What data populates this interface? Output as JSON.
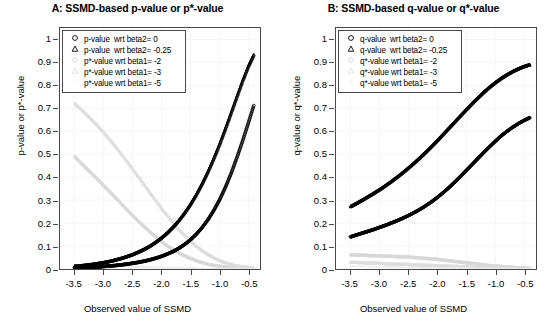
{
  "figure": {
    "width": 551,
    "height": 333,
    "background": "#ffffff"
  },
  "chart_data": [
    {
      "id": "panel-A",
      "type": "scatter",
      "title": "A: SSMD-based p-value or p*-value",
      "xlabel": "Observed value of SSMD",
      "ylabel": "p-value or p*-value",
      "xlim": [
        -3.75,
        -0.3
      ],
      "ylim": [
        0,
        1.05
      ],
      "xticks": [
        -3.5,
        -3.0,
        -2.5,
        -2.0,
        -1.5,
        -1.0,
        -0.5
      ],
      "xticklabels": [
        "-3.5",
        "-3.0",
        "-2.5",
        "-2.0",
        "-1.5",
        "-1.0",
        "-0.5"
      ],
      "yticks": [
        0,
        0.1,
        0.2,
        0.3,
        0.4,
        0.5,
        0.6,
        0.7,
        0.8,
        0.9,
        1
      ],
      "yticklabels": [
        "0",
        "0.1",
        "0.2",
        "0.3",
        "0.4",
        "0.5",
        "0.6",
        "0.7",
        "0.8",
        "0.9",
        "1"
      ],
      "grid": true,
      "legend_position": "top-left",
      "series": [
        {
          "name": "p-value  wrt beta2= 0",
          "symbol": "circle",
          "color": "#000000",
          "x": [
            -3.5,
            -3.4,
            -3.3,
            -3.2,
            -3.1,
            -3.0,
            -2.9,
            -2.8,
            -2.7,
            -2.6,
            -2.5,
            -2.4,
            -2.3,
            -2.2,
            -2.1,
            -2.0,
            -1.9,
            -1.8,
            -1.7,
            -1.6,
            -1.5,
            -1.4,
            -1.3,
            -1.2,
            -1.1,
            -1.0,
            -0.9,
            -0.8,
            -0.7,
            -0.6,
            -0.5,
            -0.4
          ],
          "y": [
            0.005,
            0.006,
            0.007,
            0.008,
            0.009,
            0.011,
            0.013,
            0.015,
            0.018,
            0.021,
            0.025,
            0.029,
            0.034,
            0.04,
            0.047,
            0.055,
            0.065,
            0.076,
            0.09,
            0.107,
            0.127,
            0.151,
            0.18,
            0.214,
            0.254,
            0.3,
            0.354,
            0.415,
            0.484,
            0.558,
            0.637,
            0.718
          ]
        },
        {
          "name": "p-value  wrt beta2= -0.25",
          "symbol": "triangle",
          "color": "#000000",
          "x": [
            -3.5,
            -3.4,
            -3.3,
            -3.2,
            -3.1,
            -3.0,
            -2.9,
            -2.8,
            -2.7,
            -2.6,
            -2.5,
            -2.4,
            -2.3,
            -2.2,
            -2.1,
            -2.0,
            -1.9,
            -1.8,
            -1.7,
            -1.6,
            -1.5,
            -1.4,
            -1.3,
            -1.2,
            -1.1,
            -1.0,
            -0.9,
            -0.8,
            -0.7,
            -0.6,
            -0.5,
            -0.4
          ],
          "y": [
            0.012,
            0.014,
            0.017,
            0.02,
            0.024,
            0.028,
            0.033,
            0.039,
            0.046,
            0.054,
            0.063,
            0.074,
            0.086,
            0.1,
            0.117,
            0.136,
            0.158,
            0.183,
            0.212,
            0.245,
            0.282,
            0.324,
            0.371,
            0.423,
            0.48,
            0.542,
            0.609,
            0.679,
            0.75,
            0.82,
            0.884,
            0.938
          ]
        },
        {
          "name": "p*-value wrt beta1= -2",
          "symbol": "circle",
          "color": "#d6d6d6",
          "x": [
            -3.5,
            -3.4,
            -3.3,
            -3.2,
            -3.1,
            -3.0,
            -2.9,
            -2.8,
            -2.7,
            -2.6,
            -2.5,
            -2.4,
            -2.3,
            -2.2,
            -2.1,
            -2.0,
            -1.9,
            -1.8,
            -1.7,
            -1.6,
            -1.5,
            -1.4,
            -1.3,
            -1.2,
            -1.1,
            -1.0,
            -0.9,
            -0.8,
            -0.7,
            -0.6,
            -0.5,
            -0.4
          ],
          "y": [
            0.49,
            0.465,
            0.44,
            0.415,
            0.39,
            0.364,
            0.338,
            0.312,
            0.286,
            0.26,
            0.234,
            0.209,
            0.185,
            0.162,
            0.14,
            0.12,
            0.101,
            0.085,
            0.07,
            0.057,
            0.046,
            0.036,
            0.028,
            0.021,
            0.016,
            0.012,
            0.009,
            0.006,
            0.004,
            0.003,
            0.002,
            0.001
          ]
        },
        {
          "name": "p*-value wrt beta1= -3",
          "symbol": "triangle",
          "color": "#dedede",
          "x": [
            -3.5,
            -3.4,
            -3.3,
            -3.2,
            -3.1,
            -3.0,
            -2.9,
            -2.8,
            -2.7,
            -2.6,
            -2.5,
            -2.4,
            -2.3,
            -2.2,
            -2.1,
            -2.0,
            -1.9,
            -1.8,
            -1.7,
            -1.6,
            -1.5,
            -1.4,
            -1.3,
            -1.2,
            -1.1,
            -1.0,
            -0.9,
            -0.8,
            -0.7,
            -0.6,
            -0.5,
            -0.4
          ],
          "y": [
            0.722,
            0.7,
            0.676,
            0.651,
            0.625,
            0.597,
            0.568,
            0.537,
            0.505,
            0.472,
            0.438,
            0.404,
            0.369,
            0.334,
            0.3,
            0.266,
            0.234,
            0.203,
            0.174,
            0.147,
            0.123,
            0.101,
            0.081,
            0.064,
            0.05,
            0.038,
            0.028,
            0.02,
            0.014,
            0.01,
            0.007,
            0.004
          ]
        },
        {
          "name": "p*-value wrt beta1= -5",
          "symbol": "dot",
          "color": "#ebebeb",
          "x": [
            -3.5,
            -3.4,
            -3.3,
            -3.2,
            -3.1,
            -3.0,
            -2.9,
            -2.8,
            -2.7,
            -2.6,
            -2.5,
            -2.4,
            -2.3,
            -2.2,
            -2.1,
            -2.0,
            -1.9,
            -1.8,
            -1.7,
            -1.6,
            -1.5,
            -1.4,
            -1.3,
            -1.2,
            -1.1,
            -1.0,
            -0.9,
            -0.8,
            -0.7,
            -0.6,
            -0.5,
            -0.4
          ],
          "y": [
            0.02,
            0.019,
            0.018,
            0.017,
            0.016,
            0.015,
            0.014,
            0.013,
            0.012,
            0.011,
            0.01,
            0.009,
            0.008,
            0.0075,
            0.007,
            0.006,
            0.0055,
            0.005,
            0.0045,
            0.004,
            0.0035,
            0.003,
            0.0028,
            0.0025,
            0.002,
            0.0018,
            0.0015,
            0.0012,
            0.001,
            0.0008,
            0.0006,
            0.0005
          ]
        }
      ]
    },
    {
      "id": "panel-B",
      "type": "scatter",
      "title": "B: SSMD-based q-value or q*-value",
      "xlabel": "Observed value of SSMD",
      "ylabel": "q-value or q*-value",
      "xlim": [
        -3.75,
        -0.3
      ],
      "ylim": [
        0,
        1.05
      ],
      "xticks": [
        -3.5,
        -3.0,
        -2.5,
        -2.0,
        -1.5,
        -1.0,
        -0.5
      ],
      "xticklabels": [
        "-3.5",
        "-3.0",
        "-2.5",
        "-2.0",
        "-1.5",
        "-1.0",
        "-0.5"
      ],
      "yticks": [
        0,
        0.1,
        0.2,
        0.3,
        0.4,
        0.5,
        0.6,
        0.7,
        0.8,
        0.9,
        1
      ],
      "yticklabels": [
        "0",
        "0.1",
        "0.2",
        "0.3",
        "0.4",
        "0.5",
        "0.6",
        "0.7",
        "0.8",
        "0.9",
        "1"
      ],
      "grid": true,
      "legend_position": "top-left",
      "series": [
        {
          "name": "q-value  wrt beta2= 0",
          "symbol": "circle",
          "color": "#000000",
          "x": [
            -3.5,
            -3.4,
            -3.3,
            -3.2,
            -3.1,
            -3.0,
            -2.9,
            -2.8,
            -2.7,
            -2.6,
            -2.5,
            -2.4,
            -2.3,
            -2.2,
            -2.1,
            -2.0,
            -1.9,
            -1.8,
            -1.7,
            -1.6,
            -1.5,
            -1.4,
            -1.3,
            -1.2,
            -1.1,
            -1.0,
            -0.9,
            -0.8,
            -0.7,
            -0.6,
            -0.5,
            -0.4
          ],
          "y": [
            0.14,
            0.148,
            0.156,
            0.164,
            0.172,
            0.181,
            0.19,
            0.2,
            0.21,
            0.221,
            0.233,
            0.246,
            0.26,
            0.276,
            0.293,
            0.312,
            0.333,
            0.355,
            0.379,
            0.404,
            0.43,
            0.456,
            0.482,
            0.508,
            0.533,
            0.557,
            0.58,
            0.6,
            0.618,
            0.634,
            0.648,
            0.66
          ]
        },
        {
          "name": "q-value  wrt beta2= -0.25",
          "symbol": "triangle",
          "color": "#000000",
          "x": [
            -3.5,
            -3.4,
            -3.3,
            -3.2,
            -3.1,
            -3.0,
            -2.9,
            -2.8,
            -2.7,
            -2.6,
            -2.5,
            -2.4,
            -2.3,
            -2.2,
            -2.1,
            -2.0,
            -1.9,
            -1.8,
            -1.7,
            -1.6,
            -1.5,
            -1.4,
            -1.3,
            -1.2,
            -1.1,
            -1.0,
            -0.9,
            -0.8,
            -0.7,
            -0.6,
            -0.5,
            -0.4
          ],
          "y": [
            0.272,
            0.286,
            0.3,
            0.315,
            0.33,
            0.346,
            0.363,
            0.381,
            0.4,
            0.42,
            0.441,
            0.463,
            0.486,
            0.51,
            0.535,
            0.561,
            0.588,
            0.615,
            0.642,
            0.669,
            0.696,
            0.722,
            0.747,
            0.771,
            0.793,
            0.813,
            0.831,
            0.847,
            0.861,
            0.873,
            0.883,
            0.891
          ]
        },
        {
          "name": "q*-value wrt beta1= -2",
          "symbol": "circle",
          "color": "#d6d6d6",
          "x": [
            -3.5,
            -3.4,
            -3.3,
            -3.2,
            -3.1,
            -3.0,
            -2.9,
            -2.8,
            -2.7,
            -2.6,
            -2.5,
            -2.4,
            -2.3,
            -2.2,
            -2.1,
            -2.0,
            -1.9,
            -1.8,
            -1.7,
            -1.6,
            -1.5,
            -1.4,
            -1.3,
            -1.2,
            -1.1,
            -1.0,
            -0.9,
            -0.8,
            -0.7,
            -0.6,
            -0.5,
            -0.4
          ],
          "y": [
            0.062,
            0.061,
            0.06,
            0.059,
            0.058,
            0.057,
            0.056,
            0.055,
            0.054,
            0.053,
            0.052,
            0.05,
            0.048,
            0.046,
            0.044,
            0.042,
            0.039,
            0.036,
            0.033,
            0.03,
            0.027,
            0.024,
            0.021,
            0.018,
            0.015,
            0.013,
            0.011,
            0.009,
            0.007,
            0.005,
            0.004,
            0.003
          ]
        },
        {
          "name": "q*-value wrt beta1= -3",
          "symbol": "triangle",
          "color": "#dedede",
          "x": [
            -3.5,
            -3.4,
            -3.3,
            -3.2,
            -3.1,
            -3.0,
            -2.9,
            -2.8,
            -2.7,
            -2.6,
            -2.5,
            -2.4,
            -2.3,
            -2.2,
            -2.1,
            -2.0,
            -1.9,
            -1.8,
            -1.7,
            -1.6,
            -1.5,
            -1.4,
            -1.3,
            -1.2,
            -1.1,
            -1.0,
            -0.9,
            -0.8,
            -0.7,
            -0.6,
            -0.5,
            -0.4
          ],
          "y": [
            0.03,
            0.029,
            0.028,
            0.027,
            0.026,
            0.025,
            0.024,
            0.023,
            0.022,
            0.021,
            0.02,
            0.019,
            0.018,
            0.017,
            0.016,
            0.015,
            0.014,
            0.013,
            0.012,
            0.011,
            0.01,
            0.009,
            0.008,
            0.007,
            0.006,
            0.005,
            0.0045,
            0.004,
            0.0035,
            0.003,
            0.0025,
            0.002
          ]
        },
        {
          "name": "q*-value wrt beta1= -5",
          "symbol": "dot",
          "color": "#ebebeb",
          "x": [
            -3.5,
            -3.4,
            -3.3,
            -3.2,
            -3.1,
            -3.0,
            -2.9,
            -2.8,
            -2.7,
            -2.6,
            -2.5,
            -2.4,
            -2.3,
            -2.2,
            -2.1,
            -2.0,
            -1.9,
            -1.8,
            -1.7,
            -1.6,
            -1.5,
            -1.4,
            -1.3,
            -1.2,
            -1.1,
            -1.0,
            -0.9,
            -0.8,
            -0.7,
            -0.6,
            -0.5,
            -0.4
          ],
          "y": [
            0.012,
            0.0115,
            0.011,
            0.0105,
            0.01,
            0.0095,
            0.009,
            0.0085,
            0.008,
            0.0075,
            0.007,
            0.0065,
            0.006,
            0.0055,
            0.005,
            0.0048,
            0.0045,
            0.0042,
            0.004,
            0.0036,
            0.0033,
            0.003,
            0.0027,
            0.0024,
            0.0021,
            0.0018,
            0.0016,
            0.0014,
            0.0012,
            0.001,
            0.0009,
            0.0008
          ]
        }
      ]
    }
  ],
  "colors": {
    "axis": "#4a4a4a",
    "grid": "#f0f0f0",
    "dark_series": "#000000",
    "light_series_1": "#d6d6d6",
    "light_series_2": "#dedede",
    "light_series_3": "#ebebeb"
  }
}
